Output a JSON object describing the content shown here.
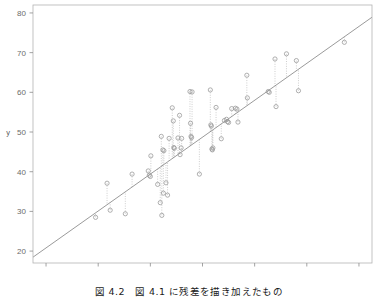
{
  "figure": {
    "caption": "図 4.2　図 4.1 に残差を描き加えたもの",
    "colors": {
      "frame": "#b3b3b3",
      "tick": "#8c8c8c",
      "tick_label": "#6b6b6b",
      "point_stroke": "#9a9a9a",
      "regression_line": "#808080",
      "residual_line": "#b8b8b8",
      "background": "#ffffff"
    }
  },
  "chart_data": {
    "type": "scatter",
    "title": "",
    "xlabel": "x",
    "ylabel": "y",
    "xlim": [
      17.5,
      82.5
    ],
    "ylim": [
      17.0,
      82.0
    ],
    "xticks": [
      20,
      30,
      40,
      50,
      60,
      70,
      80
    ],
    "yticks": [
      20,
      30,
      40,
      50,
      60,
      70,
      80
    ],
    "grid": false,
    "legend": null,
    "marker": "open-circle",
    "annotations": [
      "residual segments drawn as dotted vertical lines from each point to the regression line"
    ],
    "regression_line": {
      "slope": 0.93,
      "intercept": 2.2,
      "x_start": 17.5,
      "x_end": 82.5,
      "style": "solid"
    },
    "x": [
      29.5,
      31.7,
      32.3,
      35.2,
      36.5,
      39.6,
      39.8,
      40.0,
      40.1,
      41.4,
      41.9,
      42.1,
      42.2,
      42.4,
      42.5,
      42.6,
      43.0,
      43.3,
      43.6,
      44.2,
      44.4,
      44.5,
      44.6,
      45.3,
      45.6,
      45.7,
      45.9,
      46.0,
      47.6,
      47.7,
      47.8,
      47.9,
      48.0,
      49.4,
      51.5,
      51.6,
      51.7,
      51.8,
      51.9,
      52.0,
      52.6,
      53.6,
      54.2,
      54.6,
      54.8,
      55.0,
      55.6,
      56.3,
      56.6,
      56.8,
      58.5,
      58.6,
      62.6,
      62.8,
      63.9,
      64.1,
      66.1,
      68.0,
      68.4,
      77.2
    ],
    "y": [
      28.5,
      37.1,
      30.3,
      29.4,
      39.4,
      40.2,
      39.1,
      38.8,
      44.0,
      36.8,
      32.2,
      48.9,
      29.0,
      45.5,
      34.6,
      45.3,
      37.2,
      34.1,
      48.4,
      56.1,
      52.8,
      46.1,
      45.9,
      48.5,
      54.2,
      44.3,
      46.0,
      48.4,
      60.2,
      52.2,
      48.9,
      48.6,
      60.1,
      39.4,
      60.6,
      51.8,
      51.5,
      45.7,
      45.5,
      46.0,
      56.2,
      48.3,
      52.9,
      53.2,
      52.6,
      52.4,
      55.9,
      56.0,
      55.8,
      52.5,
      64.3,
      58.6,
      60.2,
      60.0,
      68.4,
      56.4,
      69.7,
      68.0,
      60.4,
      72.6
    ]
  }
}
